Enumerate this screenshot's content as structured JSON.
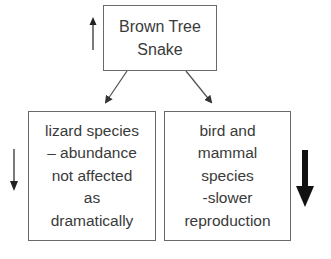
{
  "diagram": {
    "type": "flow/cause-effect",
    "nodes": [
      {
        "id": "brown-tree-snake",
        "lines": [
          "Brown Tree",
          "Snake"
        ],
        "trend": "increase",
        "trend_arrow": "thin-up"
      },
      {
        "id": "lizard-species",
        "lines": [
          "lizard species",
          "– abundance",
          "not affected",
          "as",
          "dramatically"
        ],
        "trend": "decrease",
        "trend_arrow": "thin-down"
      },
      {
        "id": "bird-mammal-species",
        "lines": [
          "bird and",
          "mammal",
          "species",
          "-slower",
          "reproduction"
        ],
        "trend": "decrease",
        "trend_arrow": "thick-down"
      }
    ],
    "edges": [
      {
        "from": "brown-tree-snake",
        "to": "lizard-species"
      },
      {
        "from": "brown-tree-snake",
        "to": "bird-mammal-species"
      }
    ],
    "colors": {
      "border": "#6a6a6a",
      "text": "#3a3a3a",
      "arrow": "#111111"
    }
  }
}
